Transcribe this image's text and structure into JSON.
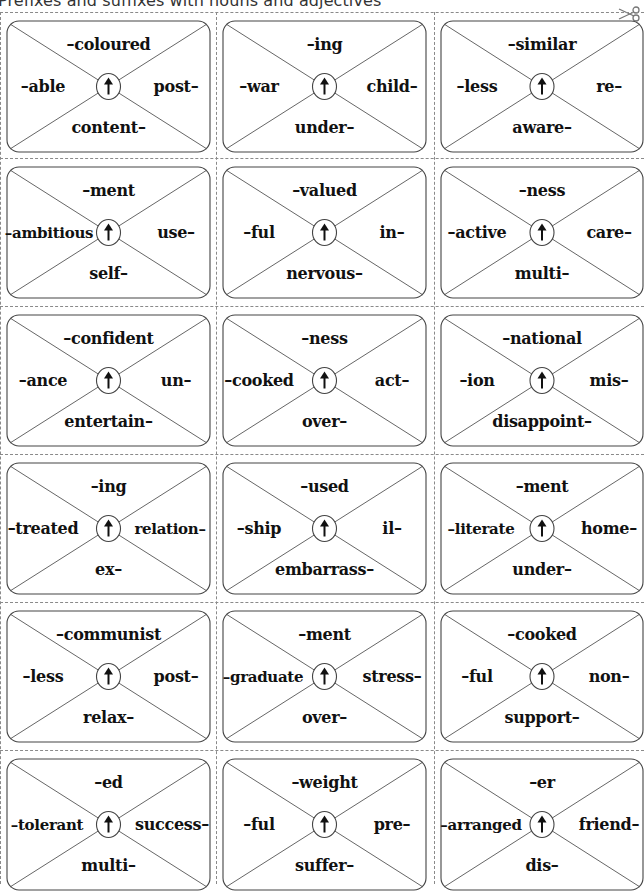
{
  "title": "Prefixes and suffixes with nouns and adjectives",
  "icons": {
    "cut_line": "scissors-icon",
    "card_center": "arrow-up-icon"
  },
  "colors": {
    "card_border": "#444444",
    "cut_line": "#8a8a8a",
    "text": "#111111"
  },
  "cards": [
    {
      "top": "–coloured",
      "left": "–able",
      "right": "post–",
      "bottom": "content–"
    },
    {
      "top": "–ing",
      "left": "–war",
      "right": "child–",
      "bottom": "under–"
    },
    {
      "top": "–similar",
      "left": "–less",
      "right": "re–",
      "bottom": "aware–"
    },
    {
      "top": "–ment",
      "left": "–ambitious",
      "right": "use–",
      "bottom": "self–"
    },
    {
      "top": "–valued",
      "left": "–ful",
      "right": "in–",
      "bottom": "nervous–"
    },
    {
      "top": "–ness",
      "left": "–active",
      "right": "care–",
      "bottom": "multi–"
    },
    {
      "top": "–confident",
      "left": "–ance",
      "right": "un–",
      "bottom": "entertain–"
    },
    {
      "top": "–ness",
      "left": "–cooked",
      "right": "act–",
      "bottom": "over–"
    },
    {
      "top": "–national",
      "left": "–ion",
      "right": "mis–",
      "bottom": "disappoint–"
    },
    {
      "top": "–ing",
      "left": "–treated",
      "right": "relation–",
      "bottom": "ex–"
    },
    {
      "top": "–used",
      "left": "–ship",
      "right": "il–",
      "bottom": "embarrass–"
    },
    {
      "top": "–ment",
      "left": "–literate",
      "right": "home–",
      "bottom": "under–"
    },
    {
      "top": "–communist",
      "left": "–less",
      "right": "post–",
      "bottom": "relax–"
    },
    {
      "top": "–ment",
      "left": "–graduate",
      "right": "stress–",
      "bottom": "over–"
    },
    {
      "top": "–cooked",
      "left": "–ful",
      "right": "non–",
      "bottom": "support–"
    },
    {
      "top": "–ed",
      "left": "–tolerant",
      "right": "success–",
      "bottom": "multi–"
    },
    {
      "top": "–weight",
      "left": "–ful",
      "right": "pre–",
      "bottom": "suffer–"
    },
    {
      "top": "–er",
      "left": "–arranged",
      "right": "friend–",
      "bottom": "dis–"
    }
  ]
}
